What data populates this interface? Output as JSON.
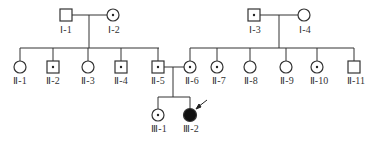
{
  "diagram": {
    "type": "pedigree",
    "colors": {
      "line": "#333333",
      "affected_fill": "#111111",
      "background": "#ffffff"
    },
    "legend_symbols": {
      "square": "male",
      "circle": "female",
      "dot": "carrier",
      "filled": "affected",
      "arrow": "proband"
    },
    "generations": [
      {
        "label": "I",
        "members": [
          {
            "id": "I-1",
            "label": "Ⅰ-1",
            "sex": "male",
            "status": "normal"
          },
          {
            "id": "I-2",
            "label": "Ⅰ-2",
            "sex": "female",
            "status": "carrier"
          },
          {
            "id": "I-3",
            "label": "Ⅰ-3",
            "sex": "male",
            "status": "carrier"
          },
          {
            "id": "I-4",
            "label": "Ⅰ-4",
            "sex": "female",
            "status": "normal"
          }
        ]
      },
      {
        "label": "II",
        "members": [
          {
            "id": "II-1",
            "label": "Ⅱ-1",
            "sex": "female",
            "status": "normal"
          },
          {
            "id": "II-2",
            "label": "Ⅱ-2",
            "sex": "male",
            "status": "carrier"
          },
          {
            "id": "II-3",
            "label": "Ⅱ-3",
            "sex": "female",
            "status": "normal"
          },
          {
            "id": "II-4",
            "label": "Ⅱ-4",
            "sex": "male",
            "status": "carrier"
          },
          {
            "id": "II-5",
            "label": "Ⅱ-5",
            "sex": "male",
            "status": "carrier"
          },
          {
            "id": "II-6",
            "label": "Ⅱ-6",
            "sex": "female",
            "status": "carrier"
          },
          {
            "id": "II-7",
            "label": "Ⅱ-7",
            "sex": "female",
            "status": "carrier"
          },
          {
            "id": "II-8",
            "label": "Ⅱ-8",
            "sex": "female",
            "status": "normal"
          },
          {
            "id": "II-9",
            "label": "Ⅱ-9",
            "sex": "female",
            "status": "normal"
          },
          {
            "id": "II-10",
            "label": "Ⅱ-10",
            "sex": "female",
            "status": "carrier"
          },
          {
            "id": "II-11",
            "label": "Ⅱ-11",
            "sex": "male",
            "status": "normal"
          }
        ]
      },
      {
        "label": "III",
        "members": [
          {
            "id": "III-1",
            "label": "Ⅲ-1",
            "sex": "female",
            "status": "carrier"
          },
          {
            "id": "III-2",
            "label": "Ⅲ-2",
            "sex": "female",
            "status": "affected",
            "proband": true
          }
        ]
      }
    ],
    "couples": [
      {
        "partners": [
          "I-1",
          "I-2"
        ],
        "children": [
          "II-1",
          "II-2",
          "II-3",
          "II-4",
          "II-5"
        ]
      },
      {
        "partners": [
          "I-3",
          "I-4"
        ],
        "children": [
          "II-6",
          "II-7",
          "II-8",
          "II-9",
          "II-10",
          "II-11"
        ]
      },
      {
        "partners": [
          "II-5",
          "II-6"
        ],
        "children": [
          "III-1",
          "III-2"
        ]
      }
    ]
  }
}
